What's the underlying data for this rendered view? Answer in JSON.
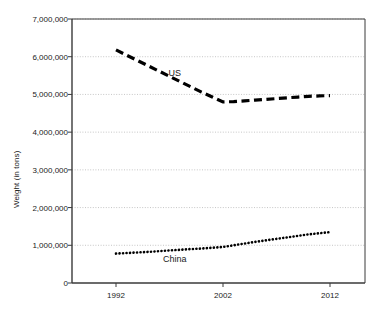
{
  "chart_data": {
    "type": "line",
    "title": "",
    "xlabel": "",
    "ylabel": "Weight (in tons)",
    "xlim": [
      1990,
      2015
    ],
    "ylim": [
      0,
      7000000
    ],
    "grid": true,
    "legend_position": "inline-labels",
    "x_ticks": [
      "1992",
      "2002",
      "2012"
    ],
    "x_tick_values": [
      1992,
      2002,
      2012
    ],
    "y_ticks": [
      "0",
      "1,000,000",
      "2,000,000",
      "3,000,000",
      "4,000,000",
      "5,000,000",
      "6,000,000",
      "7,000,000"
    ],
    "y_tick_values": [
      0,
      1000000,
      2000000,
      3000000,
      4000000,
      5000000,
      6000000,
      7000000
    ],
    "series": [
      {
        "name": "US",
        "style": "dashed",
        "color": "#000000",
        "label_x": 1997.5,
        "label_y": 5550000,
        "x": [
          1992,
          1993,
          1994,
          1995,
          1996,
          1997,
          1998,
          1999,
          2000,
          2001,
          2002,
          2003,
          2004,
          2005,
          2006,
          2007,
          2008,
          2009,
          2010,
          2011,
          2012
        ],
        "values": [
          6180000,
          6040000,
          5900000,
          5760000,
          5620000,
          5480000,
          5340000,
          5200000,
          5060000,
          4930000,
          4800000,
          4810000,
          4830000,
          4850000,
          4870000,
          4890000,
          4910000,
          4930000,
          4950000,
          4960000,
          4970000
        ]
      },
      {
        "name": "China",
        "style": "dotted",
        "color": "#000000",
        "label_x": 1997.5,
        "label_y": 600000,
        "x": [
          1992,
          1993,
          1994,
          1995,
          1996,
          1997,
          1998,
          1999,
          2000,
          2001,
          2002,
          2003,
          2004,
          2005,
          2006,
          2007,
          2008,
          2009,
          2010,
          2011,
          2012
        ],
        "values": [
          780000,
          795000,
          810000,
          825000,
          845000,
          865000,
          880000,
          900000,
          915000,
          935000,
          955000,
          1000000,
          1045000,
          1090000,
          1130000,
          1170000,
          1210000,
          1250000,
          1290000,
          1320000,
          1350000
        ]
      }
    ]
  },
  "axis_colors": {
    "axis_line": "#3a3a3a",
    "gridline": "#b8b8b8",
    "text": "#1a1a1a"
  }
}
